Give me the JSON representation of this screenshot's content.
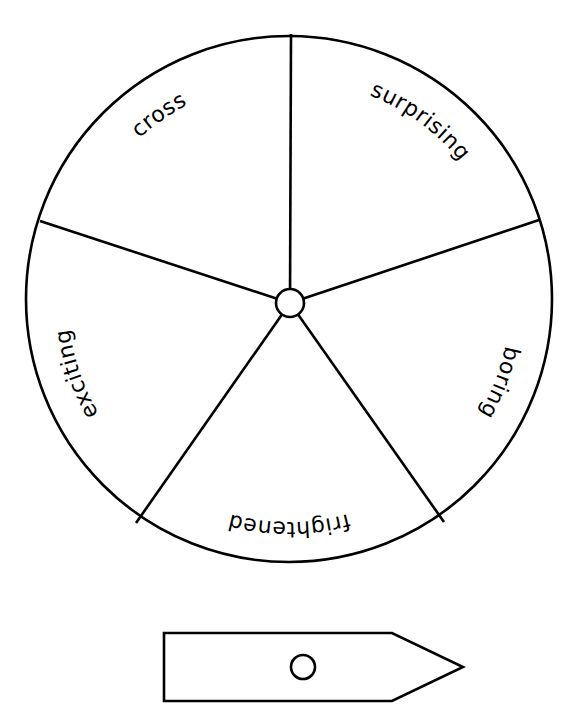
{
  "diagram": {
    "type": "spinner-wheel",
    "wheel": {
      "cx": 289,
      "cy": 299,
      "r": 263,
      "hub": {
        "cx": 290,
        "cy": 303,
        "r": 14
      },
      "spoke_ends": [
        {
          "x": 291,
          "y": 34
        },
        {
          "x": 539,
          "y": 220
        },
        {
          "x": 444,
          "y": 522
        },
        {
          "x": 136,
          "y": 523
        },
        {
          "x": 40,
          "y": 221
        }
      ],
      "text_radius": 221,
      "segments": [
        {
          "label": "cross",
          "angle_deg": 235
        },
        {
          "label": "surprising",
          "angle_deg": 306
        },
        {
          "label": "boring",
          "angle_deg": 21
        },
        {
          "label": "frightened",
          "angle_deg": 90
        },
        {
          "label": "exciting",
          "angle_deg": 161
        }
      ]
    },
    "pointer": {
      "x_left": 164,
      "y_top": 633,
      "y_bottom": 701,
      "x_notch": 392,
      "x_tip": 463,
      "y_tip": 667,
      "hole": {
        "cx": 303,
        "cy": 667,
        "r": 12
      }
    },
    "colors": {
      "stroke": "#000000",
      "background": "#ffffff"
    }
  }
}
